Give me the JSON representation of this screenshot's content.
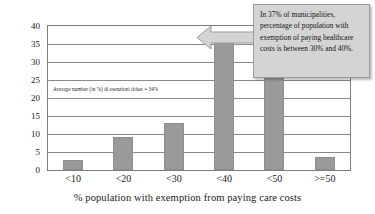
{
  "chart_data": {
    "type": "bar",
    "title": "",
    "subtitle": "",
    "xlabel": "% population with exemption from paying care costs",
    "ylabel": "Percent",
    "categories": [
      "<10",
      "<20",
      "<30",
      "<40",
      "<50",
      ">=50"
    ],
    "values": [
      2.7,
      9.3,
      13.0,
      36.5,
      33.7,
      3.7
    ],
    "ylim": [
      0,
      40
    ],
    "yticks": [
      0,
      5,
      10,
      15,
      20,
      25,
      30,
      35,
      40
    ],
    "ytick_labels": [
      "0",
      "5",
      "10",
      "15",
      "20",
      "25",
      "30",
      "35",
      "40"
    ],
    "grid": true,
    "legend": null,
    "bar_color": "#9a9a9a",
    "annotations": [
      {
        "name": "average-note",
        "text": "Average number (in %) di esenzioni ticket = 34%"
      },
      {
        "name": "callout",
        "text": "In 37% of municipalities, percentage of population with exemption of paying healthcare costs is between 30% and 40%.",
        "points_to": "<40",
        "background": "#d4d4d4",
        "border": "#9b9b9b"
      }
    ]
  },
  "axes": {
    "y_title": "Percent",
    "x_title": "% population with exemption from paying care costs"
  },
  "callout": {
    "text": "In 37% of municipalities, percentage of population with exemption of paying healthcare costs is between 30% and 40%."
  },
  "inline_note": {
    "text": "Average number (in %) di esenzioni ticket = 34%"
  }
}
